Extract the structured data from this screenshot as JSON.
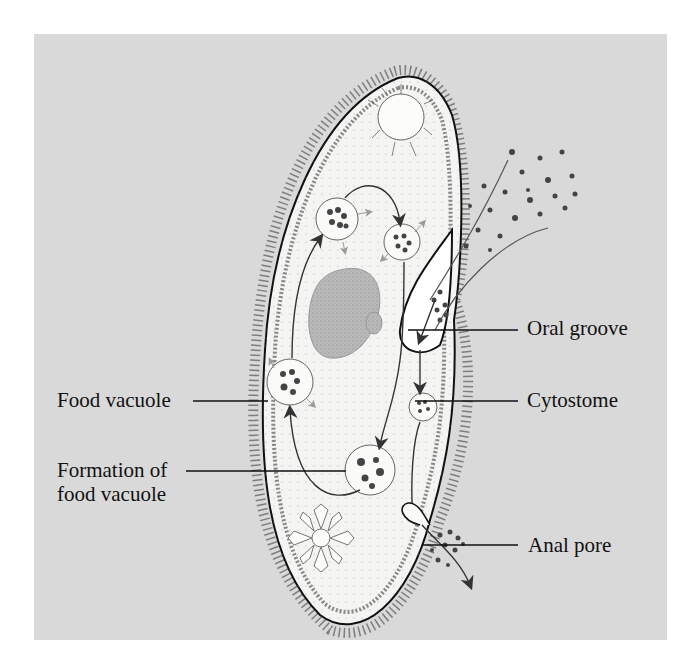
{
  "figure": {
    "background_color": "#d9d9d9",
    "cell_fill": "#f4f4f2",
    "ink_color": "#111111",
    "food_particle_color": "#444444",
    "secondary_arrow_color": "#9a9a9a"
  },
  "labels": {
    "oral_groove": "Oral groove",
    "cytostome": "Cytostome",
    "food_vacuole": "Food vacuole",
    "formation_line1": "Formation of",
    "formation_line2": "food vacuole",
    "anal_pore": "Anal pore"
  },
  "structures": [
    {
      "name": "contractile-vacuole-top"
    },
    {
      "name": "contractile-vacuole-bottom"
    },
    {
      "name": "macronucleus"
    },
    {
      "name": "micronucleus"
    },
    {
      "name": "food-vacuole"
    },
    {
      "name": "cilia"
    },
    {
      "name": "food-particles-incoming"
    },
    {
      "name": "waste-particles-outgoing"
    }
  ]
}
